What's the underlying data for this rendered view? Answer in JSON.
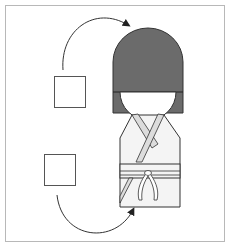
{
  "diagram": {
    "type": "doll-assembly-diagram",
    "frame": {
      "border_color": "#b8b8b8",
      "background": "#ffffff"
    },
    "parts": [
      {
        "id": "square-top",
        "label": "paper square (head)",
        "target": "doll-head"
      },
      {
        "id": "square-bottom",
        "label": "paper square (body)",
        "target": "doll-kimono"
      }
    ],
    "arrows": [
      {
        "from": "square-top",
        "to": "doll-head",
        "direction": "up-right"
      },
      {
        "from": "square-bottom",
        "to": "doll-kimono",
        "direction": "down-right"
      }
    ],
    "doll": {
      "hair_color": "#6b6b6b",
      "face_color": "#ffffff",
      "kimono_color": "#f4f4f4",
      "collar_color": "#dcdcdc",
      "outline_color": "#333333"
    }
  }
}
